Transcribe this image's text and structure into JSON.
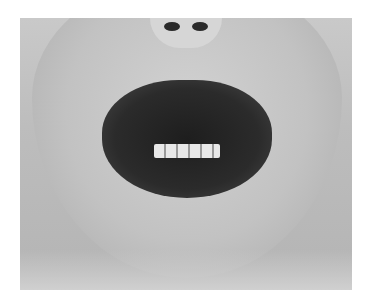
{
  "image": {
    "kind": "grayscale clinical photograph",
    "subject": "lower face close-up with crusted lesions on the lips",
    "visible_text": []
  },
  "colors": {
    "background": "#ffffff",
    "skin": "#c4c4c4",
    "lesion": "#222222",
    "teeth": "#e8e8e8"
  }
}
